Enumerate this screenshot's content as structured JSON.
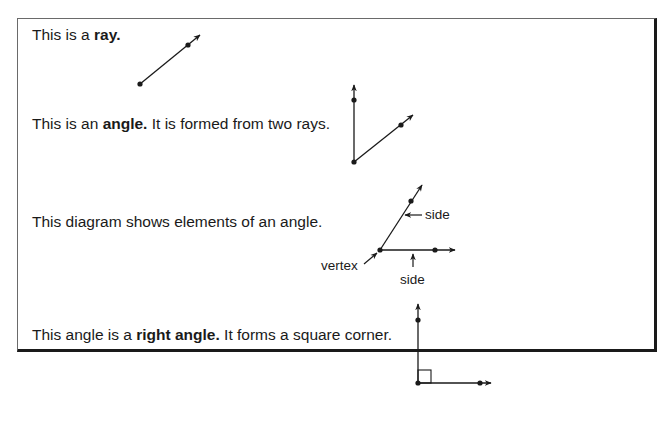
{
  "statements": [
    {
      "pre": "This is a ",
      "bold": "ray.",
      "post": ""
    },
    {
      "pre": "This is an ",
      "bold": "angle.",
      "post": " It is formed from two rays."
    },
    {
      "pre": "This diagram shows elements of an angle.",
      "bold": "",
      "post": ""
    },
    {
      "pre": "This angle is a ",
      "bold": "right angle.",
      "post": " It forms a square corner."
    }
  ],
  "diagram_labels": {
    "side_upper": "side",
    "side_lower": "side",
    "vertex": "vertex"
  },
  "figures": {
    "ray": "ray-figure",
    "angle": "angle-figure",
    "angle_elements": "angle-elements-figure",
    "right_angle": "right-angle-figure"
  },
  "colors": {
    "ink": "#1a1a1a",
    "background": "#ffffff"
  }
}
